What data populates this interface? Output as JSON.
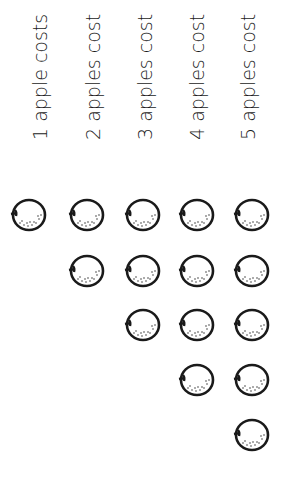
{
  "labels": [
    {
      "text": "1 apple costs"
    },
    {
      "text": "2 apples cost"
    },
    {
      "text": "3 apples cost"
    },
    {
      "text": "4 apples cost"
    },
    {
      "text": "5 apples cost"
    }
  ],
  "apple_columns": [
    {
      "count": 1
    },
    {
      "count": 2
    },
    {
      "count": 3
    },
    {
      "count": 4
    },
    {
      "count": 5
    }
  ],
  "colors": {
    "ink": "#1a1a1a",
    "background": "#ffffff"
  }
}
